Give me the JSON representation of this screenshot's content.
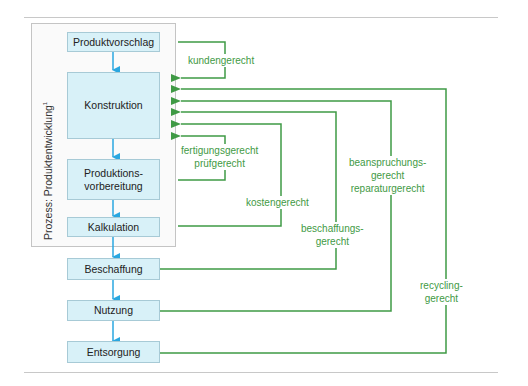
{
  "diagram": {
    "process_label": "Prozess: Produktentwicklung",
    "process_label_footnote": "1",
    "steps": [
      {
        "label": "Produktvorschlag"
      },
      {
        "label": "Konstruktion"
      },
      {
        "label": "Produktions-\nvorbereitung"
      },
      {
        "label": "Kalkulation"
      },
      {
        "label": "Beschaffung"
      },
      {
        "label": "Nutzung"
      },
      {
        "label": "Entsorgung"
      }
    ],
    "feedback": [
      {
        "label": "kundengerecht",
        "from": "Produktvorschlag",
        "to": "Konstruktion"
      },
      {
        "label": "fertigungsgerecht\nprüfgerecht",
        "from": "Produktionsvorbereitung",
        "to": "Konstruktion"
      },
      {
        "label": "kostengerecht",
        "from": "Kalkulation",
        "to": "Konstruktion"
      },
      {
        "label": "beschaffungs-\ngerecht",
        "from": "Beschaffung",
        "to": "Konstruktion"
      },
      {
        "label": "beanspruchungs-\ngerecht\nreparaturgerecht",
        "from": "Nutzung",
        "to": "Konstruktion"
      },
      {
        "label": "recycling-\ngerecht",
        "from": "Entsorgung",
        "to": "Konstruktion"
      }
    ],
    "colors": {
      "flow_arrow": "#2aa7e0",
      "feedback_line": "#3f9a45",
      "box_fill": "#d8f1f8",
      "box_border": "#a7cad6"
    }
  }
}
